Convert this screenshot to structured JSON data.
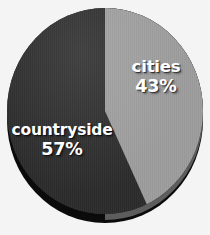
{
  "chart_data": {
    "type": "pie",
    "title": "",
    "subtitle": "",
    "xlabel": "",
    "ylabel": "",
    "grid": false,
    "legend_position": "none",
    "style": "3d-pie",
    "start_angle_deg": 0,
    "direction": "clockwise",
    "categories": [
      "cities",
      "countryside"
    ],
    "values": [
      43,
      57
    ],
    "units": "percent",
    "total": 100,
    "slices": [
      {
        "label": "cities",
        "value": 43,
        "value_label": "43%",
        "color": "#9d9d9d",
        "label_color": "#ffffff"
      },
      {
        "label": "countryside",
        "value": 57,
        "value_label": "57%",
        "color": "#2b2b2b",
        "label_color": "#ffffff"
      }
    ],
    "annotations": [
      "cities 43%",
      "countryside 57%"
    ],
    "colors": {
      "background": "#f4f4f4",
      "cities_slice": "#9d9d9d",
      "countryside_slice": "#2b2b2b",
      "depth_light": "#5d5d5d",
      "depth_dark": "#0b0b0b",
      "label_text": "#ffffff"
    }
  },
  "figure": {
    "name": "pie-chart",
    "slice_one_name": "cities",
    "slice_one_pct": "43%",
    "slice_two_name": "countryside",
    "slice_two_pct": "57%"
  }
}
